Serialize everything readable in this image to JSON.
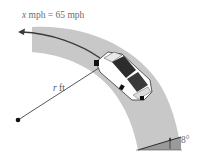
{
  "figure": {
    "speed_label": {
      "variable": "x",
      "text": " mph = 65 mph"
    },
    "radius_label": {
      "variable": "r",
      "text": " ft"
    },
    "bank_angle_label": "8°",
    "colors": {
      "road": "#c4c4c4",
      "road_cross_section": "#9e9e9e",
      "arrow": "#3a3a3a",
      "radius_line": "#444444",
      "center_point": "#111111",
      "label_text": "#6b6b6b"
    }
  }
}
